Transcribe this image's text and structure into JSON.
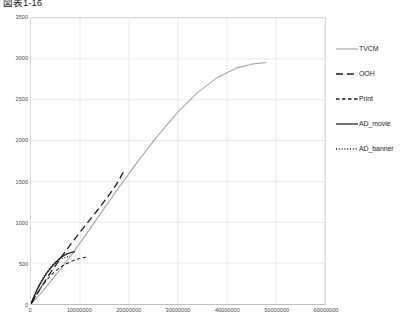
{
  "title": "図表1-16",
  "chart_data": {
    "type": "line",
    "title": "図表1-16",
    "xlabel": "",
    "ylabel": "",
    "xlim": [
      0,
      60000000
    ],
    "ylim": [
      0,
      3500
    ],
    "xticks": [
      0,
      10000000,
      20000000,
      30000000,
      40000000,
      50000000,
      60000000
    ],
    "xtick_labels": [
      "0",
      "10000000",
      "20000000",
      "30000000",
      "40000000",
      "50000000",
      "60000000"
    ],
    "yticks": [
      0,
      500,
      1000,
      1500,
      2000,
      2500,
      3000,
      3500
    ],
    "ytick_labels": [
      "0",
      "500",
      "1000",
      "1500",
      "2000",
      "2500",
      "3000",
      "3500"
    ],
    "grid": true,
    "legend_position": "right",
    "series": [
      {
        "name": "TVCM",
        "style": "solid",
        "color": "#a6a6a6",
        "width": 1.1,
        "points": [
          [
            0,
            0
          ],
          [
            1500000,
            95
          ],
          [
            3000000,
            200
          ],
          [
            5000000,
            350
          ],
          [
            8000000,
            580
          ],
          [
            11000000,
            830
          ],
          [
            14000000,
            1090
          ],
          [
            18000000,
            1430
          ],
          [
            22000000,
            1760
          ],
          [
            26000000,
            2070
          ],
          [
            30000000,
            2350
          ],
          [
            34000000,
            2590
          ],
          [
            38000000,
            2770
          ],
          [
            42000000,
            2890
          ],
          [
            45000000,
            2935
          ],
          [
            48000000,
            2955
          ]
        ]
      },
      {
        "name": "OOH",
        "style": "dashed",
        "color": "#1a1a1a",
        "width": 1.3,
        "points": [
          [
            0,
            0
          ],
          [
            600000,
            60
          ],
          [
            1400000,
            140
          ],
          [
            2400000,
            235
          ],
          [
            3600000,
            350
          ],
          [
            5000000,
            470
          ],
          [
            6500000,
            600
          ],
          [
            8200000,
            740
          ],
          [
            10000000,
            880
          ],
          [
            12000000,
            1030
          ],
          [
            14000000,
            1180
          ],
          [
            16000000,
            1340
          ],
          [
            17500000,
            1470
          ],
          [
            19000000,
            1630
          ]
        ]
      },
      {
        "name": "Print",
        "style": "dashed-short",
        "color": "#1a1a1a",
        "width": 1.0,
        "points": [
          [
            0,
            0
          ],
          [
            500000,
            55
          ],
          [
            1200000,
            125
          ],
          [
            2000000,
            200
          ],
          [
            3000000,
            280
          ],
          [
            4200000,
            360
          ],
          [
            5500000,
            430
          ],
          [
            6800000,
            480
          ],
          [
            8000000,
            515
          ],
          [
            9200000,
            545
          ],
          [
            10300000,
            562
          ],
          [
            11200000,
            572
          ]
        ]
      },
      {
        "name": "AD_movie",
        "style": "solid",
        "color": "#111111",
        "width": 1.2,
        "points": [
          [
            0,
            0
          ],
          [
            300000,
            45
          ],
          [
            700000,
            105
          ],
          [
            1200000,
            170
          ],
          [
            1800000,
            240
          ],
          [
            2500000,
            310
          ],
          [
            3300000,
            385
          ],
          [
            4200000,
            455
          ],
          [
            5200000,
            520
          ],
          [
            6200000,
            575
          ],
          [
            7200000,
            610
          ],
          [
            8200000,
            630
          ],
          [
            9000000,
            640
          ]
        ]
      },
      {
        "name": "AD_banner",
        "style": "dotted",
        "color": "#1a1a1a",
        "width": 1.1,
        "points": [
          [
            0,
            0
          ],
          [
            250000,
            40
          ],
          [
            600000,
            95
          ],
          [
            1000000,
            150
          ],
          [
            1500000,
            215
          ],
          [
            2100000,
            285
          ],
          [
            2800000,
            355
          ],
          [
            3600000,
            420
          ],
          [
            4500000,
            480
          ],
          [
            5400000,
            525
          ],
          [
            6300000,
            555
          ],
          [
            7200000,
            575
          ],
          [
            8000000,
            585
          ]
        ]
      }
    ]
  },
  "legend": {
    "items": [
      {
        "label": "TVCM",
        "style": "solid",
        "color": "#a6a6a6"
      },
      {
        "label": "OOH",
        "style": "dashed",
        "color": "#1a1a1a"
      },
      {
        "label": "Print",
        "style": "dashed-short",
        "color": "#1a1a1a"
      },
      {
        "label": "AD_movie",
        "style": "solid",
        "color": "#111111"
      },
      {
        "label": "AD_banner",
        "style": "dotted",
        "color": "#1a1a1a"
      }
    ]
  }
}
